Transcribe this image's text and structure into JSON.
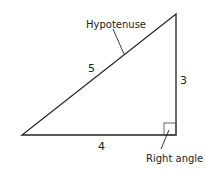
{
  "diagram": {
    "labels": {
      "hypotenuse": "Hypotenuse",
      "right_angle": "Right angle",
      "side_hypotenuse": "5",
      "side_vertical": "3",
      "side_horizontal": "4"
    },
    "vertices": [
      [
        22,
        135
      ],
      [
        176,
        135
      ],
      [
        176,
        14
      ]
    ],
    "colors": {
      "line": "#222222",
      "background": "#ffffff"
    }
  }
}
